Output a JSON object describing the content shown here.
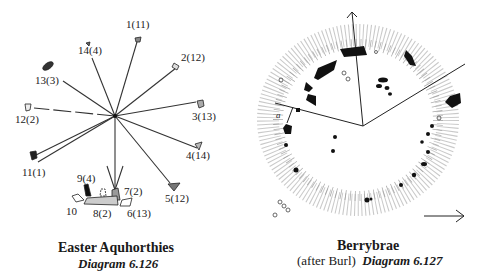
{
  "left_diagram": {
    "title": "Easter Aquhorthies",
    "subtitle": "Diagram 6.126",
    "stones": [
      {
        "label": "1(11)"
      },
      {
        "label": "2(12)"
      },
      {
        "label": "3(13)"
      },
      {
        "label": "4(14)"
      },
      {
        "label": "5(12)"
      },
      {
        "label": "6(13)"
      },
      {
        "label": "7(2)"
      },
      {
        "label": "8(2)"
      },
      {
        "label": "9(4)"
      },
      {
        "label": "10"
      },
      {
        "label": "11(1)"
      },
      {
        "label": "12(2)"
      },
      {
        "label": "13(3)"
      },
      {
        "label": "14(4)"
      }
    ]
  },
  "right_diagram": {
    "title": "Berrybrae",
    "subtitle_prefix": "(after Burl)",
    "subtitle": "Diagram 6.127",
    "small_label": "a"
  }
}
